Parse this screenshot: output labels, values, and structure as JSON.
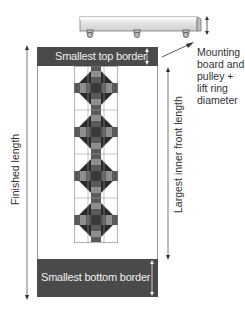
{
  "diagram": {
    "top_border_label": "Smallest top border",
    "bottom_border_label": "Smallest bottom border",
    "finished_length_label": "Finished length",
    "inner_front_length_label": "Largest inner front length",
    "mounting_label_lines": [
      "Mounting",
      "board and",
      "pulley +",
      "lift ring",
      "diameter"
    ],
    "quilt_block_count": 4,
    "pulley_count": 3,
    "colors": {
      "border_band": "#4a4a4a",
      "diamond_dark": "#2a2a2a",
      "cross_mid": "#6e6e6e",
      "cross_light": "#9a9a9a",
      "board_fill": "#e6e6e6",
      "line": "#555555"
    }
  }
}
